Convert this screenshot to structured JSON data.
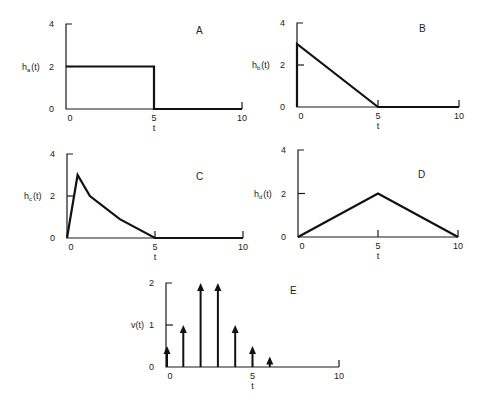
{
  "chart_data": [
    {
      "id": "A",
      "type": "line",
      "panel_label": "A",
      "ylabel": "h_a(t)",
      "ylabel_main": "h",
      "ylabel_sub": "a",
      "ylabel_arg": "(t)",
      "xlabel": "t",
      "xticks": [
        "0",
        "5",
        "10"
      ],
      "yticks": [
        "0",
        "2",
        "4"
      ],
      "xlim": [
        0,
        10
      ],
      "ylim": [
        0,
        4
      ],
      "x": [
        0,
        5,
        5,
        10
      ],
      "y": [
        2,
        2,
        0,
        0
      ],
      "description": "rectangular pulse of height 2 from t=0 to t=5"
    },
    {
      "id": "B",
      "type": "line",
      "panel_label": "B",
      "ylabel": "h_b(t)",
      "ylabel_main": "h",
      "ylabel_sub": "b",
      "ylabel_arg": "(t)",
      "xlabel": "t",
      "xticks": [
        "0",
        "5",
        "10"
      ],
      "yticks": [
        "0",
        "2",
        "4"
      ],
      "xlim": [
        0,
        10
      ],
      "ylim": [
        0,
        4
      ],
      "x": [
        0,
        0,
        5,
        10
      ],
      "y": [
        0,
        3,
        0,
        0
      ],
      "description": "jump to 3 at t=0, linear decay to 0 at t=5"
    },
    {
      "id": "C",
      "type": "line",
      "panel_label": "C",
      "ylabel": "h_c(t)",
      "ylabel_main": "h",
      "ylabel_sub": "c",
      "ylabel_arg": "(t)",
      "xlabel": "t",
      "xticks": [
        "0",
        "5",
        "10"
      ],
      "yticks": [
        "0",
        "2",
        "4"
      ],
      "xlim": [
        0,
        10
      ],
      "ylim": [
        0,
        4
      ],
      "x": [
        0,
        0.6,
        1.3,
        3,
        5,
        10
      ],
      "y": [
        0,
        3,
        2,
        0.9,
        0,
        0
      ],
      "description": "rise to 3 near t=0.6, piecewise decay to 0 at t=5"
    },
    {
      "id": "D",
      "type": "line",
      "panel_label": "D",
      "ylabel": "h_d(t)",
      "ylabel_main": "h",
      "ylabel_sub": "d",
      "ylabel_arg": "(t)",
      "xlabel": "t",
      "xticks": [
        "0",
        "5",
        "10"
      ],
      "yticks": [
        "0",
        "2",
        "4"
      ],
      "xlim": [
        0,
        10
      ],
      "ylim": [
        0,
        4
      ],
      "x": [
        0,
        5,
        10
      ],
      "y": [
        0,
        2,
        0
      ],
      "description": "triangle peaking at 2 at t=5"
    },
    {
      "id": "E",
      "type": "stem",
      "panel_label": "E",
      "ylabel": "v(t)",
      "xlabel": "t",
      "xticks": [
        "0",
        "5",
        "10"
      ],
      "yticks": [
        "0",
        "1",
        "2"
      ],
      "xlim": [
        0,
        10
      ],
      "ylim": [
        0,
        2
      ],
      "x": [
        0,
        1,
        2,
        3,
        4,
        5,
        6
      ],
      "y": [
        0.5,
        1,
        2,
        2,
        1,
        0.5,
        0.25
      ],
      "description": "impulse train (arrows)"
    }
  ]
}
